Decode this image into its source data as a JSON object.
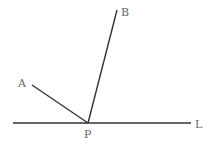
{
  "diagram": {
    "points": {
      "P": {
        "label": "P",
        "x": 88,
        "y": 123
      },
      "A": {
        "label": "A",
        "x": 32,
        "y": 85
      },
      "B": {
        "label": "B",
        "x": 117,
        "y": 10
      }
    },
    "line_L": {
      "label": "L",
      "x1": 13,
      "y1": 123,
      "x2": 191,
      "y2": 123
    },
    "segments": [
      {
        "from": "P",
        "to": "A"
      },
      {
        "from": "P",
        "to": "B"
      }
    ],
    "colors": {
      "stroke": "#333333",
      "label": "#666666",
      "background": "#ffffff"
    }
  }
}
